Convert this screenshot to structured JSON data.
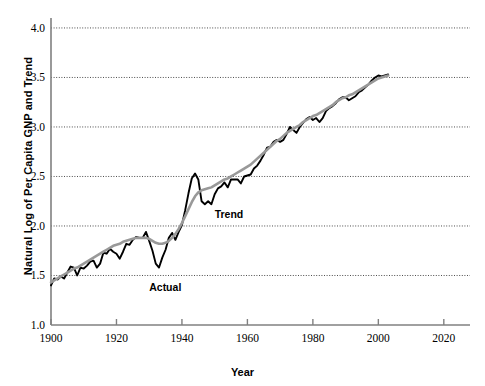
{
  "chart_data": {
    "type": "line",
    "title": "",
    "xlabel": "Year",
    "ylabel": "Natural Log of Per Capita GNP and Trend",
    "xlim": [
      1900,
      2028
    ],
    "ylim": [
      1.0,
      4.05
    ],
    "xticks": [
      1900,
      1920,
      1940,
      1960,
      1980,
      2000,
      2020
    ],
    "yticks": [
      1.0,
      1.5,
      2.0,
      2.5,
      3.0,
      3.5,
      4.0
    ],
    "ytick_labels": [
      "1.0",
      "1.5",
      "2.0",
      "2.5",
      "3.0",
      "3.5",
      "4.0"
    ],
    "xtick_labels": [
      "1900",
      "1920",
      "1940",
      "1960",
      "1980",
      "2000",
      "2020"
    ],
    "grid": "horizontal-dotted",
    "gridlines_at": [
      1.5,
      2.0,
      2.5,
      3.0,
      3.5,
      4.0
    ],
    "legend": "inline-annotations",
    "annotations": [
      {
        "text": "Actual",
        "x": 1930,
        "y": 1.44
      },
      {
        "text": "Trend",
        "x": 1950,
        "y": 2.18
      }
    ],
    "series": [
      {
        "name": "Actual",
        "color": "#000000",
        "width": 1.9,
        "x": [
          1900,
          1901,
          1902,
          1903,
          1904,
          1905,
          1906,
          1907,
          1908,
          1909,
          1910,
          1911,
          1912,
          1913,
          1914,
          1915,
          1916,
          1917,
          1918,
          1919,
          1920,
          1921,
          1922,
          1923,
          1924,
          1925,
          1926,
          1927,
          1928,
          1929,
          1930,
          1931,
          1932,
          1933,
          1934,
          1935,
          1936,
          1937,
          1938,
          1939,
          1940,
          1941,
          1942,
          1943,
          1944,
          1945,
          1946,
          1947,
          1948,
          1949,
          1950,
          1951,
          1952,
          1953,
          1954,
          1955,
          1956,
          1957,
          1958,
          1959,
          1960,
          1961,
          1962,
          1963,
          1964,
          1965,
          1966,
          1967,
          1968,
          1969,
          1970,
          1971,
          1972,
          1973,
          1974,
          1975,
          1976,
          1977,
          1978,
          1979,
          1980,
          1981,
          1982,
          1983,
          1984,
          1985,
          1986,
          1987,
          1988,
          1989,
          1990,
          1991,
          1992,
          1993,
          1994,
          1995,
          1996,
          1997,
          1998,
          1999,
          2000,
          2001,
          2002,
          2003
        ],
        "y": [
          1.4,
          1.47,
          1.46,
          1.49,
          1.47,
          1.53,
          1.59,
          1.58,
          1.5,
          1.58,
          1.57,
          1.6,
          1.64,
          1.65,
          1.58,
          1.62,
          1.73,
          1.72,
          1.77,
          1.74,
          1.72,
          1.67,
          1.74,
          1.82,
          1.81,
          1.86,
          1.89,
          1.88,
          1.88,
          1.94,
          1.85,
          1.75,
          1.62,
          1.58,
          1.68,
          1.76,
          1.88,
          1.93,
          1.86,
          1.94,
          2.01,
          2.16,
          2.33,
          2.48,
          2.53,
          2.47,
          2.25,
          2.22,
          2.25,
          2.22,
          2.32,
          2.38,
          2.4,
          2.44,
          2.39,
          2.47,
          2.47,
          2.47,
          2.43,
          2.5,
          2.51,
          2.52,
          2.58,
          2.61,
          2.66,
          2.72,
          2.79,
          2.8,
          2.85,
          2.87,
          2.85,
          2.87,
          2.93,
          3.0,
          2.97,
          2.94,
          3.0,
          3.04,
          3.08,
          3.1,
          3.07,
          3.09,
          3.05,
          3.09,
          3.16,
          3.19,
          3.21,
          3.24,
          3.28,
          3.3,
          3.3,
          3.27,
          3.29,
          3.31,
          3.35,
          3.37,
          3.4,
          3.43,
          3.47,
          3.5,
          3.52,
          3.51,
          3.52,
          3.53
        ]
      },
      {
        "name": "Trend",
        "color": "#999999",
        "width": 2.6,
        "x": [
          1900,
          1901,
          1902,
          1903,
          1904,
          1905,
          1906,
          1907,
          1908,
          1909,
          1910,
          1911,
          1912,
          1913,
          1914,
          1915,
          1916,
          1917,
          1918,
          1919,
          1920,
          1921,
          1922,
          1923,
          1924,
          1925,
          1926,
          1927,
          1928,
          1929,
          1930,
          1931,
          1932,
          1933,
          1934,
          1935,
          1936,
          1937,
          1938,
          1939,
          1940,
          1941,
          1942,
          1943,
          1944,
          1945,
          1946,
          1947,
          1948,
          1949,
          1950,
          1951,
          1952,
          1953,
          1954,
          1955,
          1956,
          1957,
          1958,
          1959,
          1960,
          1961,
          1962,
          1963,
          1964,
          1965,
          1966,
          1967,
          1968,
          1969,
          1970,
          1971,
          1972,
          1973,
          1974,
          1975,
          1976,
          1977,
          1978,
          1979,
          1980,
          1981,
          1982,
          1983,
          1984,
          1985,
          1986,
          1987,
          1988,
          1989,
          1990,
          1991,
          1992,
          1993,
          1994,
          1995,
          1996,
          1997,
          1998,
          1999,
          2000,
          2001,
          2002,
          2003
        ],
        "y": [
          1.43,
          1.45,
          1.47,
          1.49,
          1.51,
          1.53,
          1.55,
          1.57,
          1.58,
          1.6,
          1.62,
          1.64,
          1.66,
          1.68,
          1.7,
          1.72,
          1.74,
          1.76,
          1.78,
          1.8,
          1.81,
          1.82,
          1.84,
          1.85,
          1.86,
          1.87,
          1.88,
          1.88,
          1.88,
          1.88,
          1.87,
          1.85,
          1.83,
          1.82,
          1.82,
          1.83,
          1.85,
          1.88,
          1.92,
          1.97,
          2.03,
          2.1,
          2.17,
          2.24,
          2.3,
          2.34,
          2.36,
          2.37,
          2.38,
          2.39,
          2.41,
          2.43,
          2.45,
          2.47,
          2.48,
          2.5,
          2.52,
          2.54,
          2.56,
          2.58,
          2.6,
          2.62,
          2.65,
          2.68,
          2.71,
          2.74,
          2.77,
          2.8,
          2.83,
          2.86,
          2.88,
          2.91,
          2.94,
          2.96,
          2.98,
          3.0,
          3.02,
          3.05,
          3.07,
          3.09,
          3.11,
          3.12,
          3.14,
          3.16,
          3.18,
          3.2,
          3.22,
          3.25,
          3.27,
          3.29,
          3.3,
          3.32,
          3.33,
          3.35,
          3.37,
          3.39,
          3.41,
          3.43,
          3.45,
          3.47,
          3.49,
          3.5,
          3.51,
          3.52
        ]
      }
    ]
  },
  "axes": {
    "axis_color": "#808080",
    "grid_color": "#4d4d4d"
  }
}
